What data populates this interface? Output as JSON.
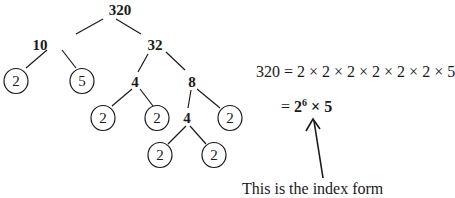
{
  "tree": {
    "nodes": [
      {
        "id": "n320",
        "label": "320",
        "x": 120,
        "y": 10,
        "circled": false
      },
      {
        "id": "n10",
        "label": "10",
        "x": 40,
        "y": 45,
        "circled": false
      },
      {
        "id": "n32",
        "label": "32",
        "x": 155,
        "y": 45,
        "circled": false
      },
      {
        "id": "n2a",
        "label": "2",
        "x": 16,
        "y": 81,
        "circled": true
      },
      {
        "id": "n5",
        "label": "5",
        "x": 82,
        "y": 81,
        "circled": true
      },
      {
        "id": "n4a",
        "label": "4",
        "x": 135,
        "y": 82,
        "circled": false
      },
      {
        "id": "n8",
        "label": "8",
        "x": 192,
        "y": 82,
        "circled": false
      },
      {
        "id": "n2b",
        "label": "2",
        "x": 103,
        "y": 118,
        "circled": true
      },
      {
        "id": "n2c",
        "label": "2",
        "x": 157,
        "y": 118,
        "circled": true
      },
      {
        "id": "n4b",
        "label": "4",
        "x": 187,
        "y": 118,
        "circled": false
      },
      {
        "id": "n2d",
        "label": "2",
        "x": 230,
        "y": 118,
        "circled": true
      },
      {
        "id": "n2e",
        "label": "2",
        "x": 160,
        "y": 155,
        "circled": true
      },
      {
        "id": "n2f",
        "label": "2",
        "x": 214,
        "y": 155,
        "circled": true
      }
    ]
  },
  "equation": {
    "line1": "320 = 2 × 2 × 2 × 2 × 2 × 2 × 5",
    "line2_prefix": "= ",
    "line2_base": "2",
    "line2_exponent": "6",
    "line2_suffix": " × 5"
  },
  "note": {
    "text": "This is the index form"
  }
}
